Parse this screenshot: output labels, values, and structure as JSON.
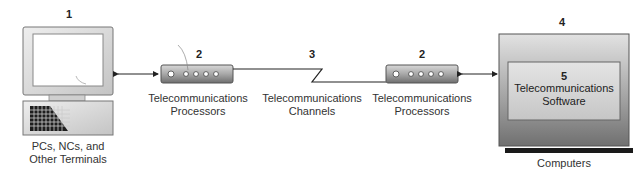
{
  "nodes": {
    "terminal": {
      "number": "1",
      "label_line1": "PCs, NCs, and",
      "label_line2": "Other Terminals"
    },
    "processor_left": {
      "number": "2",
      "label_line1": "Telecommunications",
      "label_line2": "Processors"
    },
    "channel": {
      "number": "3",
      "label_line1": "Telecommunications",
      "label_line2": "Channels"
    },
    "processor_right": {
      "number": "2",
      "label_line1": "Telecommunications",
      "label_line2": "Processors"
    },
    "computer": {
      "number": "4",
      "label": "Computers"
    },
    "software": {
      "number": "5",
      "label_line1": "Telecommunications",
      "label_line2": "Software"
    }
  },
  "colors": {
    "device_light": "#e6e6e6",
    "device_dark": "#7a7a7a",
    "line": "#222222"
  }
}
